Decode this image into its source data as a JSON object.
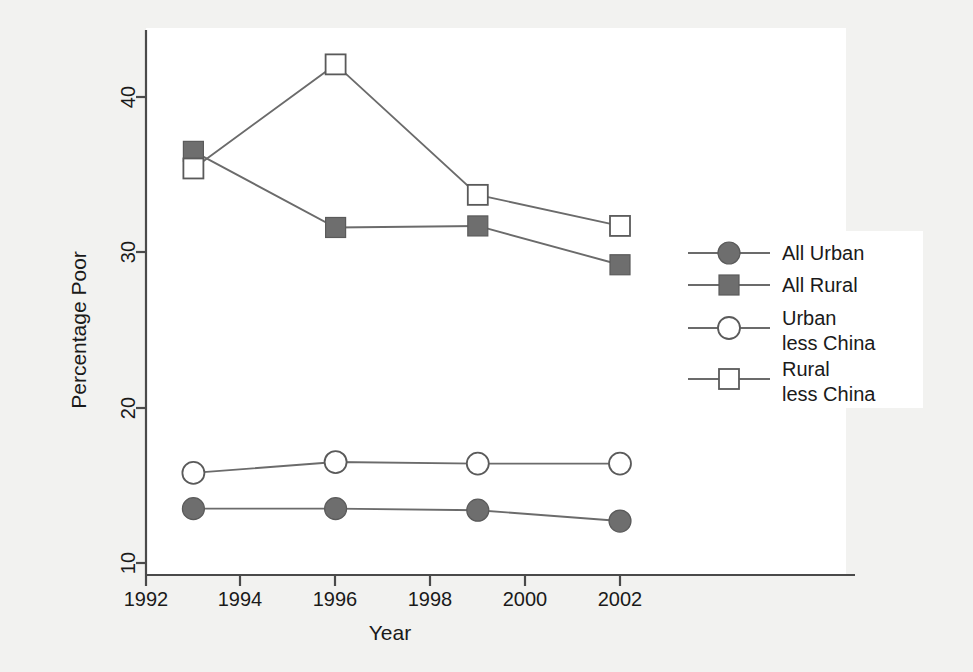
{
  "chart_data": {
    "type": "line",
    "title": "",
    "xlabel": "Year",
    "ylabel": "Percentage Poor",
    "x": [
      1993,
      1996,
      1999,
      2002
    ],
    "xlim": [
      1992,
      2002.6
    ],
    "ylim": [
      10,
      43.5
    ],
    "xticks": [
      1992,
      1994,
      1996,
      1998,
      2000,
      2002
    ],
    "xticklabels": [
      "1992",
      "1994",
      "1996",
      "1998",
      "2000",
      "2002"
    ],
    "yticks": [
      10,
      20,
      30,
      40
    ],
    "yticklabels": [
      "10",
      "20",
      "30",
      "40"
    ],
    "grid": false,
    "legend_position": "right",
    "series": [
      {
        "name": "All Urban",
        "marker": "filled-circle",
        "values": [
          13.5,
          13.5,
          13.4,
          12.7
        ]
      },
      {
        "name": "All Rural",
        "marker": "filled-square",
        "values": [
          36.5,
          31.6,
          31.7,
          29.2
        ]
      },
      {
        "name": "Urban less China",
        "marker": "open-circle",
        "values": [
          15.8,
          16.5,
          16.4,
          16.4
        ]
      },
      {
        "name": "Rural less China",
        "marker": "open-square",
        "values": [
          35.4,
          42.1,
          33.7,
          31.7
        ]
      }
    ]
  },
  "axes": {
    "ylabel": "Percentage Poor",
    "xlabel": "Year",
    "yticklabels": [
      "40",
      "30",
      "20",
      "10"
    ],
    "xticklabels": [
      "1992",
      "1994",
      "1996",
      "1998",
      "2000",
      "2002"
    ]
  },
  "legend": {
    "entries": [
      {
        "line1": "All Urban",
        "line2": "",
        "icon": "filled-circle-marker-icon"
      },
      {
        "line1": "All Rural",
        "line2": "",
        "icon": "filled-square-marker-icon"
      },
      {
        "line1": "Urban",
        "line2": "less China",
        "icon": "open-circle-marker-icon"
      },
      {
        "line1": "Rural",
        "line2": "less China",
        "icon": "open-square-marker-icon"
      }
    ]
  },
  "colors": {
    "background": "#f2f2f0",
    "plot_background": "#ffffff",
    "axis": "#4a4a4a",
    "line": "#6b6b6b",
    "marker_fill": "#6e6e6e",
    "text": "#1a1a1a"
  }
}
